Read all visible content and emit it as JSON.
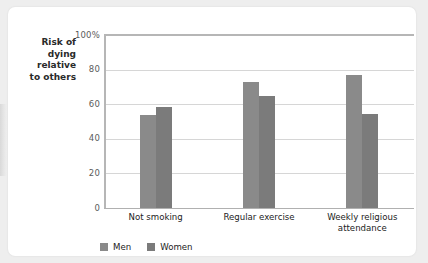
{
  "card": {
    "background_color": "#ffffff",
    "page_background_color": "#eeeeee"
  },
  "axis_title": {
    "line1": "Risk of",
    "line2": "dying",
    "line3": "relative",
    "line4": "to others"
  },
  "legend": {
    "items": [
      {
        "label": "Men",
        "color": "#8a8a8a",
        "swatch_name": "legend-swatch-men"
      },
      {
        "label": "Women",
        "color": "#7b7b7b",
        "swatch_name": "legend-swatch-women"
      }
    ]
  },
  "chart_data": {
    "type": "bar",
    "title": "",
    "subtitle": "",
    "xlabel": "",
    "ylabel": "Risk of dying relative to others",
    "categories": [
      "Not smoking",
      "Regular exercise",
      "Weekly religious attendance"
    ],
    "series": [
      {
        "name": "Men",
        "color": "#8a8a8a",
        "values": [
          54,
          73,
          77
        ]
      },
      {
        "name": "Women",
        "color": "#7b7b7b",
        "values": [
          58.5,
          65,
          54.5
        ]
      }
    ],
    "ylim": [
      0,
      100
    ],
    "ytick_values": [
      0,
      20,
      40,
      60,
      80,
      100
    ],
    "ytick_labels": [
      "0",
      "20",
      "40",
      "60",
      "80",
      "100%"
    ],
    "grid": true,
    "grid_color": "#d6d6d6",
    "legend_position": "bottom-left",
    "axis_color": "#b6b6b6"
  }
}
